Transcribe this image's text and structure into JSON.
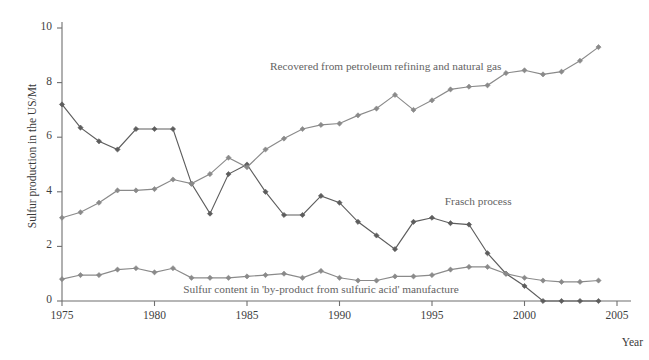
{
  "chart_data": {
    "type": "line",
    "title": "",
    "xlabel": "Year",
    "ylabel": "Sulfur production in the US/Mt",
    "xlim": [
      1975,
      2005
    ],
    "ylim": [
      0,
      10
    ],
    "xticks": [
      1975,
      1980,
      1985,
      1990,
      1995,
      2000,
      2005
    ],
    "yticks": [
      0,
      2,
      4,
      6,
      8,
      10
    ],
    "grid": false,
    "legend_position": "inline-annotations",
    "x": [
      1975,
      1976,
      1977,
      1978,
      1979,
      1980,
      1981,
      1982,
      1983,
      1984,
      1985,
      1986,
      1987,
      1988,
      1989,
      1990,
      1991,
      1992,
      1993,
      1994,
      1995,
      1996,
      1997,
      1998,
      1999,
      2000,
      2001,
      2002,
      2003,
      2004
    ],
    "series": [
      {
        "name": "Frasch process",
        "color": "#5d5d5d",
        "marker": "diamond",
        "values": [
          7.2,
          6.35,
          5.85,
          5.55,
          6.3,
          6.3,
          6.3,
          4.3,
          3.2,
          4.65,
          5.0,
          4.0,
          3.15,
          3.15,
          3.85,
          3.6,
          2.9,
          2.4,
          1.9,
          2.9,
          3.05,
          2.85,
          2.8,
          1.75,
          1.0,
          0.55,
          0.0,
          0.0,
          0.0,
          0.0
        ]
      },
      {
        "name": "Recovered from petroleum refining and natural gas",
        "color": "#8a8a8a",
        "marker": "diamond",
        "values": [
          3.05,
          3.25,
          3.6,
          4.05,
          4.05,
          4.1,
          4.45,
          4.3,
          4.65,
          5.25,
          4.9,
          5.55,
          5.95,
          6.3,
          6.45,
          6.5,
          6.8,
          7.05,
          7.55,
          7.0,
          7.35,
          7.75,
          7.85,
          7.9,
          8.35,
          8.45,
          8.3,
          8.4,
          8.8,
          9.3
        ]
      },
      {
        "name": "Sulfur content in 'by-product from sulfuric acid' manufacture",
        "color": "#8a8a8a",
        "marker": "diamond",
        "values": [
          0.8,
          0.95,
          0.95,
          1.15,
          1.2,
          1.05,
          1.2,
          0.85,
          0.85,
          0.85,
          0.9,
          0.95,
          1.0,
          0.85,
          1.1,
          0.85,
          0.75,
          0.75,
          0.9,
          0.9,
          0.95,
          1.15,
          1.25,
          1.25,
          1.0,
          0.85,
          0.75,
          0.7,
          0.7,
          0.75
        ]
      }
    ],
    "annotations": [
      {
        "text": "Recovered from petroleum refining and natural gas",
        "x": 1992.5,
        "y": 8.55,
        "name": "annotation-recovered"
      },
      {
        "text": "Frasch process",
        "x": 1997.5,
        "y": 3.6,
        "name": "annotation-frasch"
      },
      {
        "text": "Sulfur content in 'by-product from sulfuric acid' manufacture",
        "x": 1989.0,
        "y": 0.38,
        "name": "annotation-byproduct"
      }
    ]
  },
  "axes": {
    "ylabel": "Sulfur production in the US/Mt",
    "xlabel": "Year",
    "yticks": [
      "0",
      "2",
      "4",
      "6",
      "8",
      "10"
    ],
    "xticks": [
      "1975",
      "1980",
      "1985",
      "1990",
      "1995",
      "2000",
      "2005"
    ]
  },
  "caption": {
    "text": "Fig. 10.2 Production of sulfur in the US from 1975 to 2004 ..."
  },
  "colors": {
    "axis": "#6f6f6f",
    "frasch": "#5d5d5d",
    "recovered": "#8a8a8a",
    "byproduct": "#8a8a8a",
    "text": "#3a3a3a"
  }
}
